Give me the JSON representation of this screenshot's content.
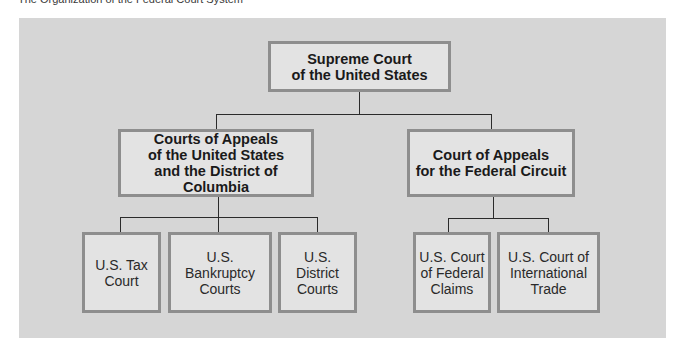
{
  "caption": "The Organization of the Federal Court System",
  "colors": {
    "panel_background": "#d6d6d6",
    "box_fill": "#e3e3e3",
    "box_border": "#8e8e8e",
    "connector": "#2b2b2b"
  },
  "chart": {
    "root": {
      "label": "Supreme Court\nof the United States"
    },
    "level2": [
      {
        "label": "Courts of Appeals\nof the United States\nand the District of Columbia",
        "children": [
          {
            "label": "U.S. Tax\nCourt"
          },
          {
            "label": "U.S.\nBankruptcy\nCourts"
          },
          {
            "label": "U.S.\nDistrict\nCourts"
          }
        ]
      },
      {
        "label": "Court of Appeals\nfor the Federal Circuit",
        "children": [
          {
            "label": "U.S. Court\nof Federal\nClaims"
          },
          {
            "label": "U.S. Court of\nInternational\nTrade"
          }
        ]
      }
    ]
  }
}
